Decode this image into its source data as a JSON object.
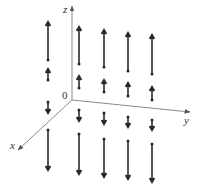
{
  "figure": {
    "type": "3d-vector-field",
    "colors": {
      "axis": "#8a8a8a",
      "arrow": "#2a2a2a",
      "text": "#333333",
      "background": "#ffffff"
    },
    "axes": {
      "origin_label": "0",
      "x_label": "x",
      "y_label": "y",
      "z_label": "z"
    },
    "columns": [
      {
        "x": 48,
        "arrows": [
          {
            "from": 60,
            "to": 20
          },
          {
            "from": 80,
            "to": 67
          },
          {
            "from": 102,
            "to": 115
          },
          {
            "from": 130,
            "to": 172
          }
        ]
      },
      {
        "x": 79,
        "arrows": [
          {
            "from": 64,
            "to": 25
          },
          {
            "from": 88,
            "to": 74
          },
          {
            "from": 110,
            "to": 123
          },
          {
            "from": 134,
            "to": 176
          }
        ]
      },
      {
        "x": 104,
        "arrows": [
          {
            "from": 67,
            "to": 28
          },
          {
            "from": 92,
            "to": 78
          },
          {
            "from": 113,
            "to": 126
          },
          {
            "from": 139,
            "to": 179
          }
        ]
      },
      {
        "x": 128,
        "arrows": [
          {
            "from": 71,
            "to": 31
          },
          {
            "from": 96,
            "to": 81
          },
          {
            "from": 117,
            "to": 129
          },
          {
            "from": 141,
            "to": 181
          }
        ]
      },
      {
        "x": 152,
        "arrows": [
          {
            "from": 74,
            "to": 33
          },
          {
            "from": 100,
            "to": 85
          },
          {
            "from": 120,
            "to": 132
          },
          {
            "from": 144,
            "to": 184
          }
        ]
      }
    ]
  }
}
